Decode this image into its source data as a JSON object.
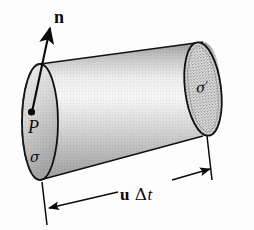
{
  "figure": {
    "background_color": "#fdfdfd",
    "ink_color": "#0b0b0b",
    "labels": {
      "normal_vector": "n",
      "point": "P",
      "near_face": "σ",
      "far_face": "σ′",
      "length_u": "u",
      "length_delta": "Δ",
      "length_t": "t"
    },
    "elements": {
      "normal_arrow_name": "normal-vector-arrow",
      "point_marker_name": "point-p-marker",
      "near_face_name": "near-face-ellipse",
      "far_face_name": "far-face-ellipse",
      "body_name": "cylinder-body",
      "hidden_edge_name": "hidden-back-edge-dashed",
      "dimension_name": "length-dimension-arrow"
    },
    "colors": {
      "outline": "#111111",
      "body_light": "#f2f2f2",
      "body_mid": "#c9c9c9",
      "body_dark": "#8f8f8f",
      "face_light": "#ededed",
      "face_dark": "#a8a8a8",
      "stipple": "#7d7d7d"
    },
    "geometry": {
      "near_face_center_x": 40,
      "near_face_center_y": 122,
      "near_face_rx": 18,
      "near_face_ry": 58,
      "far_face_center_x": 203,
      "far_face_center_y": 89,
      "far_face_rx": 18,
      "far_face_ry": 47,
      "axis_tilt_deg": -12,
      "arrow_tip_x": 50,
      "arrow_tip_y": 27,
      "arrow_tail_x": 32,
      "arrow_tail_y": 112
    }
  }
}
